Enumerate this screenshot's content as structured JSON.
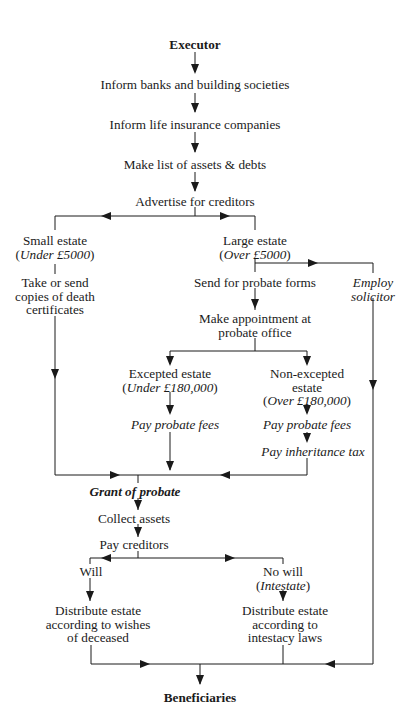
{
  "diagram": {
    "title": "Executor",
    "nodes": {
      "executor": {
        "text": "Executor"
      },
      "inform_banks": {
        "text": "Inform banks and building societies"
      },
      "inform_life": {
        "text": "Inform life insurance companies"
      },
      "make_list": {
        "text": "Make list of assets & debts"
      },
      "advertise": {
        "text": "Advertise for creditors"
      },
      "small_estate": {
        "line1": "Small estate",
        "line2_open": "(",
        "line2_ital": "Under £5000",
        "line2_close": ")"
      },
      "take_send": {
        "line1": "Take or send",
        "line2": "copies of death",
        "line3": "certificates"
      },
      "large_estate": {
        "line1": "Large estate",
        "line2_open": "(",
        "line2_ital": "Over £5000",
        "line2_close": ")"
      },
      "send_forms": {
        "text": "Send for probate forms"
      },
      "employ_solicitor": {
        "line1": "Employ",
        "line2": "solicitor"
      },
      "make_appointment": {
        "line1": "Make appointment at",
        "line2": "probate office"
      },
      "excepted": {
        "line1": "Excepted estate",
        "line2_open": "(",
        "line2_ital": "Under £180,000",
        "line2_close": ")"
      },
      "non_excepted": {
        "line1": "Non-excepted",
        "line2": "estate",
        "line3_open": "(",
        "line3_ital": "Over £180,000",
        "line3_close": ")"
      },
      "pay_fees_left": {
        "text": "Pay probate fees"
      },
      "pay_fees_right": {
        "text": "Pay probate fees"
      },
      "pay_tax": {
        "text": "Pay inheritance tax"
      },
      "grant": {
        "text": "Grant of probate"
      },
      "collect": {
        "text": "Collect assets"
      },
      "pay_creditors": {
        "text": "Pay creditors"
      },
      "will": {
        "text": "Will"
      },
      "no_will": {
        "line1": "No will",
        "line2_open": "(",
        "line2_ital": "Intestate",
        "line2_close": ")"
      },
      "distribute_will": {
        "line1": "Distribute estate",
        "line2": "according to wishes",
        "line3": "of deceased"
      },
      "distribute_intestate": {
        "line1": "Distribute estate",
        "line2": "according to",
        "line3": "intestacy laws"
      },
      "beneficiaries": {
        "text": "Beneficiaries"
      }
    },
    "colors": {
      "line": "#1a1a1a",
      "text": "#1a1a1a",
      "background": "#ffffff"
    }
  }
}
